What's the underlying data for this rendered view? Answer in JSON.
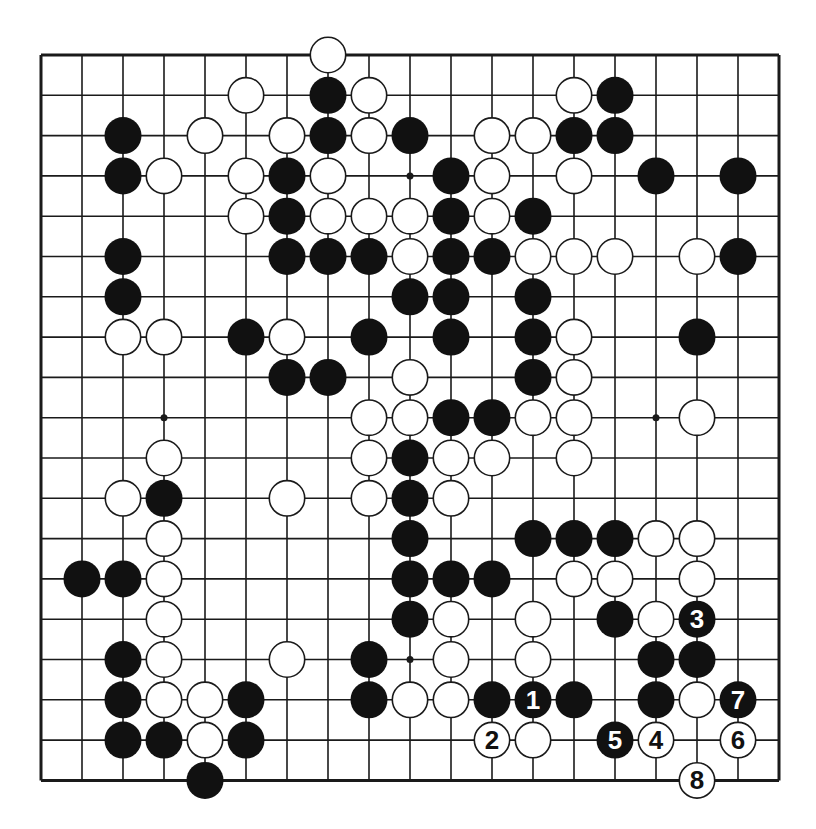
{
  "diagram": {
    "type": "go-board",
    "size": 19,
    "colors": {
      "line": "#1a1a1a",
      "black_stone": "#111111",
      "white_stone": "#ffffff",
      "background": "#ffffff"
    },
    "hoshi": [
      [
        9,
        3
      ],
      [
        3,
        9
      ],
      [
        15,
        9
      ],
      [
        9,
        15
      ]
    ],
    "stones": [
      {
        "c": 7,
        "r": 0,
        "color": "white"
      },
      {
        "c": 5,
        "r": 1,
        "color": "white"
      },
      {
        "c": 7,
        "r": 1,
        "color": "black"
      },
      {
        "c": 8,
        "r": 1,
        "color": "white"
      },
      {
        "c": 13,
        "r": 1,
        "color": "white"
      },
      {
        "c": 14,
        "r": 1,
        "color": "black"
      },
      {
        "c": 2,
        "r": 2,
        "color": "black"
      },
      {
        "c": 4,
        "r": 2,
        "color": "white"
      },
      {
        "c": 6,
        "r": 2,
        "color": "white"
      },
      {
        "c": 7,
        "r": 2,
        "color": "black"
      },
      {
        "c": 8,
        "r": 2,
        "color": "white"
      },
      {
        "c": 9,
        "r": 2,
        "color": "black"
      },
      {
        "c": 11,
        "r": 2,
        "color": "white"
      },
      {
        "c": 12,
        "r": 2,
        "color": "white"
      },
      {
        "c": 13,
        "r": 2,
        "color": "black"
      },
      {
        "c": 14,
        "r": 2,
        "color": "black"
      },
      {
        "c": 2,
        "r": 3,
        "color": "black"
      },
      {
        "c": 3,
        "r": 3,
        "color": "white"
      },
      {
        "c": 5,
        "r": 3,
        "color": "white"
      },
      {
        "c": 6,
        "r": 3,
        "color": "black"
      },
      {
        "c": 7,
        "r": 3,
        "color": "white"
      },
      {
        "c": 10,
        "r": 3,
        "color": "black"
      },
      {
        "c": 11,
        "r": 3,
        "color": "white"
      },
      {
        "c": 13,
        "r": 3,
        "color": "white"
      },
      {
        "c": 15,
        "r": 3,
        "color": "black"
      },
      {
        "c": 17,
        "r": 3,
        "color": "black"
      },
      {
        "c": 5,
        "r": 4,
        "color": "white"
      },
      {
        "c": 6,
        "r": 4,
        "color": "black"
      },
      {
        "c": 7,
        "r": 4,
        "color": "white"
      },
      {
        "c": 8,
        "r": 4,
        "color": "white"
      },
      {
        "c": 9,
        "r": 4,
        "color": "white"
      },
      {
        "c": 10,
        "r": 4,
        "color": "black"
      },
      {
        "c": 11,
        "r": 4,
        "color": "white"
      },
      {
        "c": 12,
        "r": 4,
        "color": "black"
      },
      {
        "c": 2,
        "r": 5,
        "color": "black"
      },
      {
        "c": 6,
        "r": 5,
        "color": "black"
      },
      {
        "c": 7,
        "r": 5,
        "color": "black"
      },
      {
        "c": 8,
        "r": 5,
        "color": "black"
      },
      {
        "c": 9,
        "r": 5,
        "color": "white"
      },
      {
        "c": 10,
        "r": 5,
        "color": "black"
      },
      {
        "c": 11,
        "r": 5,
        "color": "black"
      },
      {
        "c": 12,
        "r": 5,
        "color": "white"
      },
      {
        "c": 13,
        "r": 5,
        "color": "white"
      },
      {
        "c": 14,
        "r": 5,
        "color": "white"
      },
      {
        "c": 16,
        "r": 5,
        "color": "white"
      },
      {
        "c": 17,
        "r": 5,
        "color": "black"
      },
      {
        "c": 2,
        "r": 6,
        "color": "black"
      },
      {
        "c": 9,
        "r": 6,
        "color": "black"
      },
      {
        "c": 10,
        "r": 6,
        "color": "black"
      },
      {
        "c": 12,
        "r": 6,
        "color": "black"
      },
      {
        "c": 2,
        "r": 7,
        "color": "white"
      },
      {
        "c": 3,
        "r": 7,
        "color": "white"
      },
      {
        "c": 5,
        "r": 7,
        "color": "black"
      },
      {
        "c": 6,
        "r": 7,
        "color": "white"
      },
      {
        "c": 8,
        "r": 7,
        "color": "black"
      },
      {
        "c": 10,
        "r": 7,
        "color": "black"
      },
      {
        "c": 12,
        "r": 7,
        "color": "black"
      },
      {
        "c": 13,
        "r": 7,
        "color": "white"
      },
      {
        "c": 16,
        "r": 7,
        "color": "black"
      },
      {
        "c": 6,
        "r": 8,
        "color": "black"
      },
      {
        "c": 7,
        "r": 8,
        "color": "black"
      },
      {
        "c": 9,
        "r": 8,
        "color": "white"
      },
      {
        "c": 12,
        "r": 8,
        "color": "black"
      },
      {
        "c": 13,
        "r": 8,
        "color": "white"
      },
      {
        "c": 8,
        "r": 9,
        "color": "white"
      },
      {
        "c": 9,
        "r": 9,
        "color": "white"
      },
      {
        "c": 10,
        "r": 9,
        "color": "black"
      },
      {
        "c": 11,
        "r": 9,
        "color": "black"
      },
      {
        "c": 12,
        "r": 9,
        "color": "white"
      },
      {
        "c": 13,
        "r": 9,
        "color": "white"
      },
      {
        "c": 16,
        "r": 9,
        "color": "white"
      },
      {
        "c": 3,
        "r": 10,
        "color": "white"
      },
      {
        "c": 8,
        "r": 10,
        "color": "white"
      },
      {
        "c": 9,
        "r": 10,
        "color": "black"
      },
      {
        "c": 10,
        "r": 10,
        "color": "white"
      },
      {
        "c": 11,
        "r": 10,
        "color": "white"
      },
      {
        "c": 13,
        "r": 10,
        "color": "white"
      },
      {
        "c": 2,
        "r": 11,
        "color": "white"
      },
      {
        "c": 3,
        "r": 11,
        "color": "black"
      },
      {
        "c": 6,
        "r": 11,
        "color": "white"
      },
      {
        "c": 8,
        "r": 11,
        "color": "white"
      },
      {
        "c": 9,
        "r": 11,
        "color": "black"
      },
      {
        "c": 10,
        "r": 11,
        "color": "white"
      },
      {
        "c": 3,
        "r": 12,
        "color": "white"
      },
      {
        "c": 9,
        "r": 12,
        "color": "black"
      },
      {
        "c": 12,
        "r": 12,
        "color": "black"
      },
      {
        "c": 13,
        "r": 12,
        "color": "black"
      },
      {
        "c": 14,
        "r": 12,
        "color": "black"
      },
      {
        "c": 15,
        "r": 12,
        "color": "white"
      },
      {
        "c": 16,
        "r": 12,
        "color": "white"
      },
      {
        "c": 1,
        "r": 13,
        "color": "black"
      },
      {
        "c": 2,
        "r": 13,
        "color": "black"
      },
      {
        "c": 3,
        "r": 13,
        "color": "white"
      },
      {
        "c": 9,
        "r": 13,
        "color": "black"
      },
      {
        "c": 10,
        "r": 13,
        "color": "black"
      },
      {
        "c": 11,
        "r": 13,
        "color": "black"
      },
      {
        "c": 13,
        "r": 13,
        "color": "white"
      },
      {
        "c": 14,
        "r": 13,
        "color": "white"
      },
      {
        "c": 16,
        "r": 13,
        "color": "white"
      },
      {
        "c": 3,
        "r": 14,
        "color": "white"
      },
      {
        "c": 9,
        "r": 14,
        "color": "black"
      },
      {
        "c": 10,
        "r": 14,
        "color": "white"
      },
      {
        "c": 12,
        "r": 14,
        "color": "white"
      },
      {
        "c": 14,
        "r": 14,
        "color": "black"
      },
      {
        "c": 15,
        "r": 14,
        "color": "white"
      },
      {
        "c": 16,
        "r": 14,
        "color": "black",
        "label": "3"
      },
      {
        "c": 2,
        "r": 15,
        "color": "black"
      },
      {
        "c": 3,
        "r": 15,
        "color": "white"
      },
      {
        "c": 6,
        "r": 15,
        "color": "white"
      },
      {
        "c": 8,
        "r": 15,
        "color": "black"
      },
      {
        "c": 10,
        "r": 15,
        "color": "white"
      },
      {
        "c": 12,
        "r": 15,
        "color": "white"
      },
      {
        "c": 15,
        "r": 15,
        "color": "black"
      },
      {
        "c": 16,
        "r": 15,
        "color": "black"
      },
      {
        "c": 2,
        "r": 16,
        "color": "black"
      },
      {
        "c": 3,
        "r": 16,
        "color": "white"
      },
      {
        "c": 4,
        "r": 16,
        "color": "white"
      },
      {
        "c": 5,
        "r": 16,
        "color": "black"
      },
      {
        "c": 8,
        "r": 16,
        "color": "black"
      },
      {
        "c": 9,
        "r": 16,
        "color": "white"
      },
      {
        "c": 10,
        "r": 16,
        "color": "white"
      },
      {
        "c": 11,
        "r": 16,
        "color": "black"
      },
      {
        "c": 12,
        "r": 16,
        "color": "black",
        "label": "1"
      },
      {
        "c": 13,
        "r": 16,
        "color": "black"
      },
      {
        "c": 15,
        "r": 16,
        "color": "black"
      },
      {
        "c": 16,
        "r": 16,
        "color": "white"
      },
      {
        "c": 17,
        "r": 16,
        "color": "black",
        "label": "7"
      },
      {
        "c": 2,
        "r": 17,
        "color": "black"
      },
      {
        "c": 3,
        "r": 17,
        "color": "black"
      },
      {
        "c": 4,
        "r": 17,
        "color": "white"
      },
      {
        "c": 5,
        "r": 17,
        "color": "black"
      },
      {
        "c": 11,
        "r": 17,
        "color": "white",
        "label": "2"
      },
      {
        "c": 12,
        "r": 17,
        "color": "white"
      },
      {
        "c": 14,
        "r": 17,
        "color": "black",
        "label": "5"
      },
      {
        "c": 15,
        "r": 17,
        "color": "white",
        "label": "4"
      },
      {
        "c": 17,
        "r": 17,
        "color": "white",
        "label": "6"
      },
      {
        "c": 4,
        "r": 18,
        "color": "black"
      },
      {
        "c": 16,
        "r": 18,
        "color": "white",
        "label": "8"
      }
    ]
  }
}
